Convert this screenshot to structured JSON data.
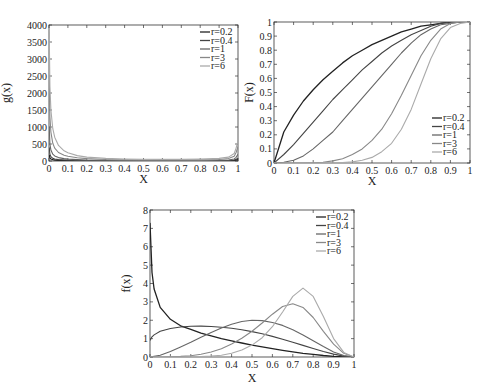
{
  "chart_data": [
    {
      "id": "g",
      "type": "line",
      "title": "",
      "xlabel": "X",
      "ylabel": "g(x)",
      "xlim": [
        0,
        1
      ],
      "ylim": [
        0,
        4000
      ],
      "xticks": [
        "0",
        "0.1",
        "0.2",
        "0.3",
        "0.4",
        "0.5",
        "0.6",
        "0.7",
        "0.8",
        "0.9",
        "1"
      ],
      "yticks": [
        "0",
        "500",
        "1000",
        "1500",
        "2000",
        "2500",
        "3000",
        "3500",
        "4000"
      ],
      "legend_position": "upper right",
      "grid": false,
      "x": [
        0.001,
        0.005,
        0.01,
        0.02,
        0.03,
        0.05,
        0.08,
        0.1,
        0.15,
        0.2,
        0.3,
        0.4,
        0.5,
        0.6,
        0.7,
        0.8,
        0.9,
        0.95,
        0.98,
        0.99,
        1.0
      ],
      "series": [
        {
          "name": "r=0.2",
          "color": "#222222",
          "values": [
            180,
            90,
            60,
            40,
            30,
            22,
            16,
            14,
            11,
            9,
            7,
            6,
            5,
            5,
            5,
            6,
            8,
            12,
            20,
            30,
            40
          ]
        },
        {
          "name": "r=0.4",
          "color": "#444444",
          "values": [
            400,
            200,
            130,
            80,
            60,
            40,
            28,
            22,
            16,
            12,
            9,
            7,
            6,
            6,
            6,
            7,
            10,
            15,
            30,
            50,
            80
          ]
        },
        {
          "name": "r=1",
          "color": "#666666",
          "values": [
            1000,
            500,
            320,
            200,
            150,
            100,
            70,
            55,
            40,
            30,
            20,
            15,
            13,
            12,
            12,
            14,
            20,
            30,
            60,
            110,
            200
          ]
        },
        {
          "name": "r=3",
          "color": "#888888",
          "values": [
            2500,
            1300,
            850,
            520,
            380,
            250,
            170,
            140,
            95,
            70,
            45,
            35,
            30,
            28,
            28,
            32,
            45,
            70,
            140,
            250,
            420
          ]
        },
        {
          "name": "r=6",
          "color": "#aaaaaa",
          "values": [
            3800,
            2200,
            1500,
            950,
            700,
            460,
            300,
            240,
            160,
            115,
            75,
            58,
            50,
            48,
            48,
            55,
            75,
            115,
            220,
            380,
            600
          ]
        }
      ]
    },
    {
      "id": "F",
      "type": "line",
      "title": "",
      "xlabel": "X",
      "ylabel": "F(x)",
      "xlim": [
        0,
        1
      ],
      "ylim": [
        0,
        1
      ],
      "xticks": [
        "0",
        "0.1",
        "0.2",
        "0.3",
        "0.4",
        "0.5",
        "0.6",
        "0.7",
        "0.8",
        "0.9",
        "1"
      ],
      "yticks": [
        "0",
        "0.1",
        "0.2",
        "0.3",
        "0.4",
        "0.5",
        "0.6",
        "0.7",
        "0.8",
        "0.9",
        "1"
      ],
      "legend_position": "lower right",
      "grid": false,
      "x": [
        0,
        0.05,
        0.1,
        0.15,
        0.2,
        0.25,
        0.3,
        0.35,
        0.4,
        0.45,
        0.5,
        0.55,
        0.6,
        0.65,
        0.7,
        0.75,
        0.8,
        0.85,
        0.9,
        0.95,
        1.0
      ],
      "series": [
        {
          "name": "r=0.2",
          "color": "#222222",
          "values": [
            0,
            0.22,
            0.34,
            0.44,
            0.52,
            0.59,
            0.65,
            0.71,
            0.76,
            0.8,
            0.84,
            0.87,
            0.9,
            0.93,
            0.95,
            0.97,
            0.98,
            0.99,
            1.0,
            1.0,
            1.0
          ]
        },
        {
          "name": "r=0.4",
          "color": "#444444",
          "values": [
            0,
            0.06,
            0.13,
            0.21,
            0.29,
            0.37,
            0.45,
            0.52,
            0.59,
            0.66,
            0.72,
            0.78,
            0.83,
            0.87,
            0.91,
            0.94,
            0.97,
            0.99,
            1.0,
            1.0,
            1.0
          ]
        },
        {
          "name": "r=1",
          "color": "#666666",
          "values": [
            0,
            0.005,
            0.02,
            0.05,
            0.1,
            0.16,
            0.22,
            0.3,
            0.38,
            0.46,
            0.54,
            0.62,
            0.7,
            0.78,
            0.85,
            0.91,
            0.95,
            0.98,
            0.99,
            1.0,
            1.0
          ]
        },
        {
          "name": "r=3",
          "color": "#888888",
          "values": [
            0,
            0,
            0,
            0,
            0.002,
            0.006,
            0.015,
            0.03,
            0.06,
            0.1,
            0.16,
            0.24,
            0.35,
            0.48,
            0.62,
            0.76,
            0.87,
            0.95,
            0.99,
            1.0,
            1.0
          ]
        },
        {
          "name": "r=6",
          "color": "#aaaaaa",
          "values": [
            0,
            0,
            0,
            0,
            0,
            0,
            0.001,
            0.003,
            0.008,
            0.02,
            0.04,
            0.08,
            0.14,
            0.24,
            0.38,
            0.56,
            0.74,
            0.88,
            0.96,
            0.99,
            1.0
          ]
        }
      ]
    },
    {
      "id": "f",
      "type": "line",
      "title": "",
      "xlabel": "X",
      "ylabel": "f(x)",
      "xlim": [
        0,
        1
      ],
      "ylim": [
        0,
        8
      ],
      "xticks": [
        "0",
        "0.1",
        "0.2",
        "0.3",
        "0.4",
        "0.5",
        "0.6",
        "0.7",
        "0.8",
        "0.9",
        "1"
      ],
      "yticks": [
        "0",
        "1",
        "2",
        "3",
        "4",
        "5",
        "6",
        "7",
        "8"
      ],
      "legend_position": "upper right",
      "grid": false,
      "x": [
        0,
        0.01,
        0.02,
        0.05,
        0.1,
        0.15,
        0.2,
        0.25,
        0.3,
        0.35,
        0.4,
        0.45,
        0.5,
        0.55,
        0.6,
        0.65,
        0.7,
        0.75,
        0.8,
        0.85,
        0.9,
        0.95,
        1.0
      ],
      "series": [
        {
          "name": "r=0.2",
          "color": "#222222",
          "values": [
            7.3,
            4.6,
            3.7,
            2.7,
            2.05,
            1.7,
            1.5,
            1.3,
            1.15,
            1.0,
            0.88,
            0.76,
            0.65,
            0.55,
            0.45,
            0.36,
            0.28,
            0.2,
            0.14,
            0.08,
            0.04,
            0.01,
            0
          ]
        },
        {
          "name": "r=0.4",
          "color": "#444444",
          "values": [
            0.9,
            1.1,
            1.2,
            1.4,
            1.55,
            1.63,
            1.67,
            1.68,
            1.66,
            1.62,
            1.56,
            1.48,
            1.38,
            1.26,
            1.12,
            0.97,
            0.8,
            0.63,
            0.46,
            0.3,
            0.16,
            0.05,
            0
          ]
        },
        {
          "name": "r=1",
          "color": "#666666",
          "values": [
            0,
            0.01,
            0.03,
            0.1,
            0.3,
            0.55,
            0.8,
            1.08,
            1.34,
            1.58,
            1.78,
            1.93,
            2.0,
            1.98,
            1.88,
            1.72,
            1.48,
            1.2,
            0.88,
            0.57,
            0.28,
            0.08,
            0
          ]
        },
        {
          "name": "r=3",
          "color": "#888888",
          "values": [
            0,
            0,
            0,
            0,
            0.01,
            0.03,
            0.07,
            0.15,
            0.27,
            0.45,
            0.7,
            1.02,
            1.4,
            1.85,
            2.33,
            2.75,
            2.9,
            2.7,
            2.15,
            1.4,
            0.7,
            0.2,
            0
          ]
        },
        {
          "name": "r=6",
          "color": "#aaaaaa",
          "values": [
            0,
            0,
            0,
            0,
            0,
            0,
            0.01,
            0.02,
            0.05,
            0.1,
            0.2,
            0.38,
            0.65,
            1.05,
            1.65,
            2.45,
            3.3,
            3.75,
            3.3,
            2.2,
            1.0,
            0.25,
            0
          ]
        }
      ]
    }
  ]
}
